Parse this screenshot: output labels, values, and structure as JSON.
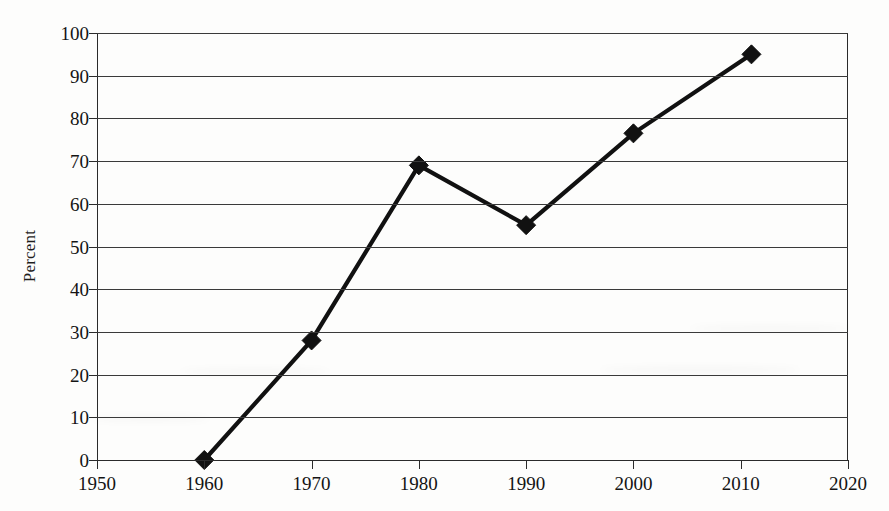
{
  "chart_data": {
    "type": "line",
    "title": "",
    "subtitle": "",
    "xlabel": "",
    "ylabel": "Percent",
    "xlim": [
      1950,
      2020
    ],
    "ylim": [
      0,
      100
    ],
    "grid": true,
    "legend": false,
    "marker": "filled-diamond",
    "line_color": "#111111",
    "marker_color": "#111111",
    "x": [
      1960,
      1970,
      1980,
      1990,
      2000,
      2011
    ],
    "values": [
      0,
      28,
      69,
      55,
      76.5,
      95
    ],
    "points": [
      {
        "x": 1960,
        "y": 0
      },
      {
        "x": 1970,
        "y": 28
      },
      {
        "x": 1980,
        "y": 69
      },
      {
        "x": 1990,
        "y": 55
      },
      {
        "x": 2000,
        "y": 76.5
      },
      {
        "x": 2011,
        "y": 95
      }
    ],
    "x_ticks": [
      1950,
      1960,
      1970,
      1980,
      1990,
      2000,
      2010,
      2020
    ],
    "x_tick_labels": [
      "1950",
      "1960",
      "1970",
      "1980",
      "1990",
      "2000",
      "2010",
      "2020"
    ],
    "y_ticks": [
      0,
      10,
      20,
      30,
      40,
      50,
      60,
      70,
      80,
      90,
      100
    ],
    "y_tick_labels": [
      "0",
      "10",
      "20",
      "30",
      "40",
      "50",
      "60",
      "70",
      "80",
      "90",
      "100"
    ]
  },
  "axes": {
    "y_title": "Percent"
  }
}
